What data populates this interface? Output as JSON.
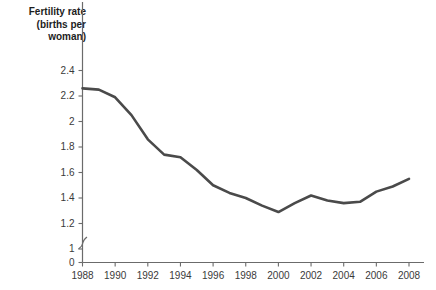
{
  "chart_data": {
    "type": "line",
    "title": "Fertility rate (births per woman)",
    "ylabel": "Fertility rate (births per woman)",
    "xlabel": "",
    "grid": false,
    "legend": null,
    "axis_break": true,
    "axis_break_note": "y-axis broken between 0 and 1",
    "xlim": [
      1988,
      2008
    ],
    "ylim": [
      1.0,
      2.4
    ],
    "yticks": [
      "0",
      "1",
      "1.2",
      "1.4",
      "1.6",
      "1.8",
      "2",
      "2.2",
      "2.4"
    ],
    "ytick_values": [
      0,
      1,
      1.2,
      1.4,
      1.6,
      1.8,
      2,
      2.2,
      2.4
    ],
    "xticks": [
      "1988",
      "1990",
      "1992",
      "1994",
      "1996",
      "1998",
      "2000",
      "2002",
      "2004",
      "2006",
      "2008"
    ],
    "xtick_values": [
      1988,
      1990,
      1992,
      1994,
      1996,
      1998,
      2000,
      2002,
      2004,
      2006,
      2008
    ],
    "x": [
      1988,
      1989,
      1990,
      1991,
      1992,
      1993,
      1994,
      1995,
      1996,
      1997,
      1998,
      1999,
      2000,
      2001,
      2002,
      2003,
      2004,
      2005,
      2006,
      2007,
      2008
    ],
    "values": [
      2.26,
      2.24,
      2.14,
      1.96,
      1.78,
      1.73,
      1.71,
      1.6,
      1.48,
      1.43,
      1.39,
      1.36,
      1.3,
      1.28,
      1.33,
      1.42,
      1.38,
      1.36,
      1.36,
      1.41,
      1.49
    ],
    "series": [
      {
        "name": "Fertility rate",
        "color": "#4a4a4a",
        "points": [
          {
            "x": 1988,
            "y": 2.26
          },
          {
            "x": 1989,
            "y": 2.25
          },
          {
            "x": 1990,
            "y": 2.19
          },
          {
            "x": 1991,
            "y": 2.05
          },
          {
            "x": 1992,
            "y": 1.86
          },
          {
            "x": 1993,
            "y": 1.74
          },
          {
            "x": 1994,
            "y": 1.72
          },
          {
            "x": 1995,
            "y": 1.62
          },
          {
            "x": 1996,
            "y": 1.5
          },
          {
            "x": 1997,
            "y": 1.44
          },
          {
            "x": 1998,
            "y": 1.4
          },
          {
            "x": 1999,
            "y": 1.34
          },
          {
            "x": 2000,
            "y": 1.29
          },
          {
            "x": 2001,
            "y": 1.36
          },
          {
            "x": 2002,
            "y": 1.42
          },
          {
            "x": 2003,
            "y": 1.38
          },
          {
            "x": 2004,
            "y": 1.36
          },
          {
            "x": 2005,
            "y": 1.37
          },
          {
            "x": 2006,
            "y": 1.45
          },
          {
            "x": 2007,
            "y": 1.49
          },
          {
            "x": 2008,
            "y": 1.55
          }
        ]
      }
    ],
    "annotations": []
  },
  "colors": {
    "line": "#4a4a4a",
    "axis": "#6b6b6b",
    "text": "#3a3a3a",
    "title_text": "#1d1d1d",
    "background": "#ffffff"
  }
}
